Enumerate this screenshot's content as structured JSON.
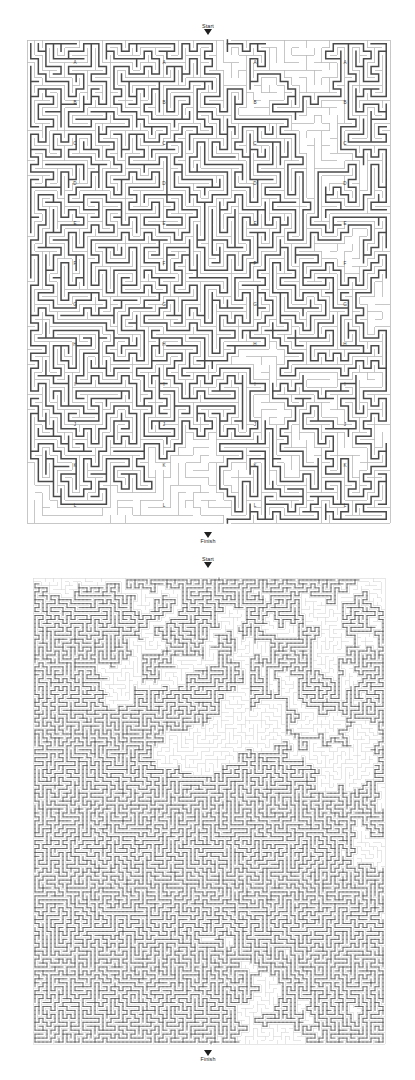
{
  "page": {
    "background_color": "#ffffff",
    "width": 415,
    "height": 1080
  },
  "mazes": [
    {
      "id": "maze-coarse",
      "name": "top-maze",
      "start_label": "Start",
      "finish_label": "Finish",
      "row_labels": [
        "A",
        "B",
        "C",
        "D",
        "E",
        "F",
        "G",
        "H",
        "I",
        "J",
        "K",
        "L"
      ],
      "label_columns": 4,
      "grid": {
        "cols": 48,
        "rows": 64,
        "cell_px": 7.55
      },
      "wall_color": "#b9b9b9",
      "solution_color": "#4a4a4a",
      "bounds": {
        "x": 27,
        "y": 40,
        "width": 363,
        "height": 483
      }
    },
    {
      "id": "maze-fine",
      "name": "bottom-maze",
      "start_label": "Start",
      "finish_label": "Finish",
      "row_labels": [],
      "label_columns": 0,
      "grid": {
        "cols": 88,
        "rows": 118,
        "cell_px": 4.0
      },
      "wall_color": "#d4d4d4",
      "solution_color": "#555555",
      "bounds": {
        "x": 33,
        "y": 578,
        "width": 352,
        "height": 466
      }
    }
  ],
  "colors": {
    "wall_light": "#bdbdbd",
    "wall_fine": "#d6d6d6",
    "solution_dark": "#4a4a4a",
    "text": "#1a1a1a",
    "arrow": "#1f1f1f"
  }
}
